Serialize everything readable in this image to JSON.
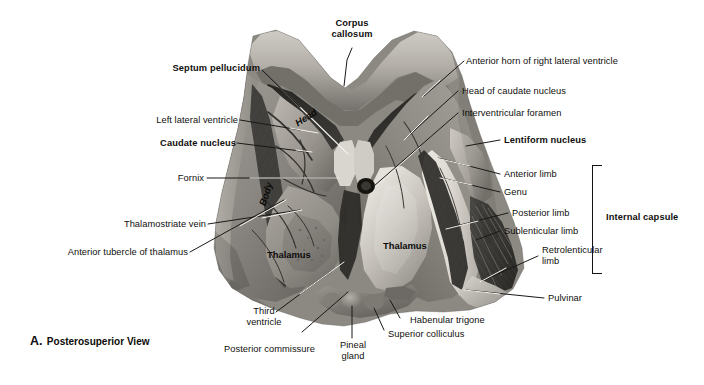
{
  "figure": {
    "caption_letter": "A.",
    "caption_text": "Posterosuperior View",
    "view_title": "A. Posterosuperior View"
  },
  "top_labels": {
    "corpus_callosum": "Corpus\ncallosum",
    "corpus_callosum_line1": "Corpus",
    "corpus_callosum_line2": "callosum"
  },
  "left_labels": [
    {
      "id": "septum-pellucidum",
      "text": "Septum pellucidum",
      "bold": true
    },
    {
      "id": "left-lateral-ventricle",
      "text": "Left lateral ventricle",
      "bold": false
    },
    {
      "id": "caudate-nucleus",
      "text": "Caudate nucleus",
      "bold": true
    },
    {
      "id": "fornix",
      "text": "Fornix",
      "bold": false
    },
    {
      "id": "thalamostriate-vein",
      "text": "Thalamostriate vein",
      "bold": false
    },
    {
      "id": "anterior-tubercle-of-thalamus",
      "text": "Anterior tubercle of thalamus",
      "bold": false
    }
  ],
  "right_labels": [
    {
      "id": "anterior-horn-of-right-lateral-ventricle",
      "text": "Anterior horn of right lateral ventricle",
      "bold": false
    },
    {
      "id": "head-of-caudate-nucleus",
      "text": "Head of caudate nucleus",
      "bold": false
    },
    {
      "id": "interventricular-foramen",
      "text": "Interventricular foramen",
      "bold": false
    },
    {
      "id": "lentiform-nucleus",
      "text": "Lentiform nucleus",
      "bold": true
    },
    {
      "id": "anterior-limb",
      "text": "Anterior limb",
      "bold": false
    },
    {
      "id": "genu",
      "text": "Genu",
      "bold": false
    },
    {
      "id": "posterior-limb",
      "text": "Posterior limb",
      "bold": false
    },
    {
      "id": "sublenticular-limb",
      "text": "Sublenticular limb",
      "bold": false
    },
    {
      "id": "retrolenticular-limb",
      "text": "Retrolenticular\nlimb",
      "bold": false
    },
    {
      "id": "pulvinar",
      "text": "Pulvinar",
      "bold": false
    }
  ],
  "retrolenticular": {
    "line1": "Retrolenticular",
    "line2": "limb"
  },
  "bracket_label": {
    "internal_capsule": "Internal capsule"
  },
  "bottom_labels": [
    {
      "id": "third-ventricle-line1",
      "text": "Third"
    },
    {
      "id": "third-ventricle-line2",
      "text": "ventricle"
    },
    {
      "id": "posterior-commissure",
      "text": "Posterior commissure"
    },
    {
      "id": "pineal-gland-line1",
      "text": "Pineal"
    },
    {
      "id": "pineal-gland-line2",
      "text": "gland"
    },
    {
      "id": "superior-colliculus",
      "text": "Superior colliculus"
    },
    {
      "id": "habenular-trigone",
      "text": "Habenular trigone"
    }
  ],
  "third_ventricle": {
    "line1": "Third",
    "line2": "ventricle"
  },
  "pineal_gland": {
    "line1": "Pineal",
    "line2": "gland"
  },
  "posterior_commissure": {
    "text": "Posterior commissure"
  },
  "superior_colliculus": {
    "text": "Superior colliculus"
  },
  "habenular_trigone": {
    "text": "Habenular trigone"
  },
  "on_image_labels": {
    "head": "Head",
    "body": "Body",
    "thalamus_left": "Thalamus",
    "thalamus_right": "Thalamus"
  },
  "colors": {
    "text": "#100f0d",
    "leader_light": "#f2f1ee",
    "leader_dark": "#1a1917",
    "background": "#ffffff",
    "specimen_mid": "#8e8b86",
    "specimen_light": "#d6d3cd",
    "specimen_dark": "#2b2a28"
  }
}
